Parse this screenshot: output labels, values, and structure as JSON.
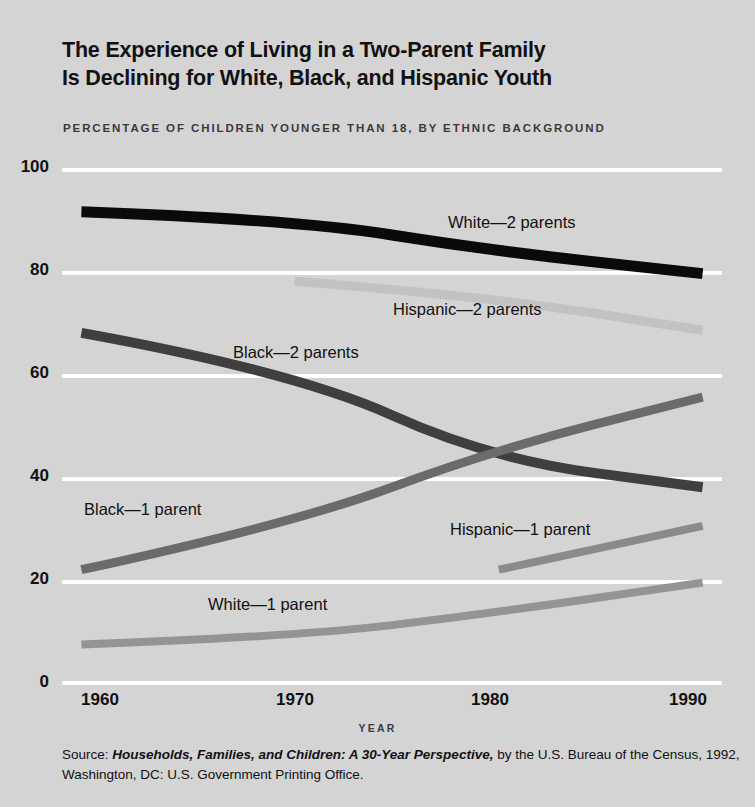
{
  "title": {
    "line1": "The Experience of Living in a Two-Parent Family",
    "line2": "Is Declining for White, Black, and Hispanic Youth"
  },
  "subtitle": "PERCENTAGE OF CHILDREN YOUNGER THAN 18, BY ETHNIC BACKGROUND",
  "source": {
    "prefix": "Source: ",
    "italic": "Households, Families, and Children: A 30-Year Perspective,",
    "rest": " by the U.S. Bureau of the Census, 1992, Washington, DC: U.S. Government Printing Office."
  },
  "colors": {
    "background": "#d4d4d4",
    "grid": "#ffffff",
    "white_2parents": "#0a0a0a",
    "black_2parents": "#3f3f3f",
    "black_1parent": "#6b6b6b",
    "hispanic_2parents": "#c2c2c2",
    "hispanic_1parent": "#8a8a8a",
    "white_1parent": "#949494"
  },
  "chart_data": {
    "type": "line",
    "title": "The Experience of Living in a Two-Parent Family Is Declining for White, Black, and Hispanic Youth",
    "subtitle": "PERCENTAGE OF CHILDREN YOUNGER THAN 18, BY ETHNIC BACKGROUND",
    "xlabel": "YEAR",
    "ylabel": "",
    "xlim": [
      1958,
      1992
    ],
    "ylim": [
      0,
      100
    ],
    "yticks": [
      0,
      20,
      40,
      60,
      80,
      100
    ],
    "xticks": [
      1960,
      1970,
      1980,
      1990
    ],
    "grid": true,
    "legend": "inline-labels",
    "series": [
      {
        "name": "White—2 parents",
        "color": "#0a0a0a",
        "x": [
          1959,
          1970,
          1980,
          1991
        ],
        "values": [
          91.5,
          90,
          84,
          79.5
        ]
      },
      {
        "name": "Hispanic—2 parents",
        "color": "#c2c2c2",
        "x": [
          1970,
          1980,
          1991
        ],
        "values": [
          78,
          75,
          68.5
        ]
      },
      {
        "name": "Black—2 parents",
        "color": "#3f3f3f",
        "x": [
          1959,
          1970,
          1980,
          1991
        ],
        "values": [
          68,
          60.5,
          43.5,
          38
        ]
      },
      {
        "name": "Black—1 parent",
        "color": "#6b6b6b",
        "x": [
          1959,
          1970,
          1980,
          1991
        ],
        "values": [
          22,
          31,
          45,
          55.5
        ]
      },
      {
        "name": "Hispanic—1 parent",
        "color": "#8a8a8a",
        "x": [
          1980.5,
          1991
        ],
        "values": [
          22,
          30.5
        ]
      },
      {
        "name": "White—1 parent",
        "color": "#949494",
        "x": [
          1959,
          1970,
          1980,
          1991
        ],
        "values": [
          7.5,
          9,
          13.5,
          19.5
        ]
      }
    ]
  },
  "axis": {
    "x_tick_labels": [
      "1960",
      "1970",
      "1980",
      "1990"
    ],
    "y_tick_labels": [
      "100",
      "80",
      "60",
      "40",
      "20",
      "0"
    ],
    "x_axis_name": "YEAR"
  },
  "series_labels": [
    {
      "text": "White—2 parents",
      "left": "448px",
      "top": "213px"
    },
    {
      "text": "Hispanic—2 parents",
      "left": "393px",
      "top": "300px"
    },
    {
      "text": "Black—2 parents",
      "left": "233px",
      "top": "343px"
    },
    {
      "text": "Black—1 parent",
      "left": "84px",
      "top": "500px"
    },
    {
      "text": "Hispanic—1 parent",
      "left": "450px",
      "top": "520px"
    },
    {
      "text": "White—1 parent",
      "left": "208px",
      "top": "595px"
    }
  ]
}
